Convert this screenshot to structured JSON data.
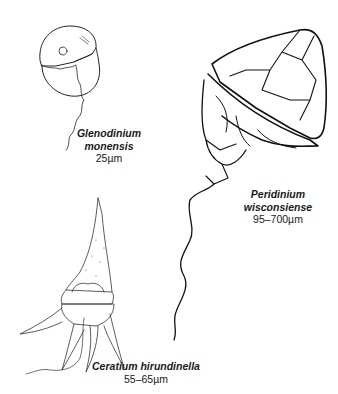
{
  "organisms": [
    {
      "id": "glenodinium",
      "genus": "Glenodinium",
      "species": "monensis",
      "size": "25µm"
    },
    {
      "id": "peridinium",
      "genus": "Peridinium",
      "species": "wisconsiense",
      "size": "95–700µm"
    },
    {
      "id": "ceratium",
      "name": "Ceratium hirundinella",
      "size": "55–65µm"
    }
  ],
  "colors": {
    "ink": "#1a1a1a",
    "background": "#ffffff"
  }
}
